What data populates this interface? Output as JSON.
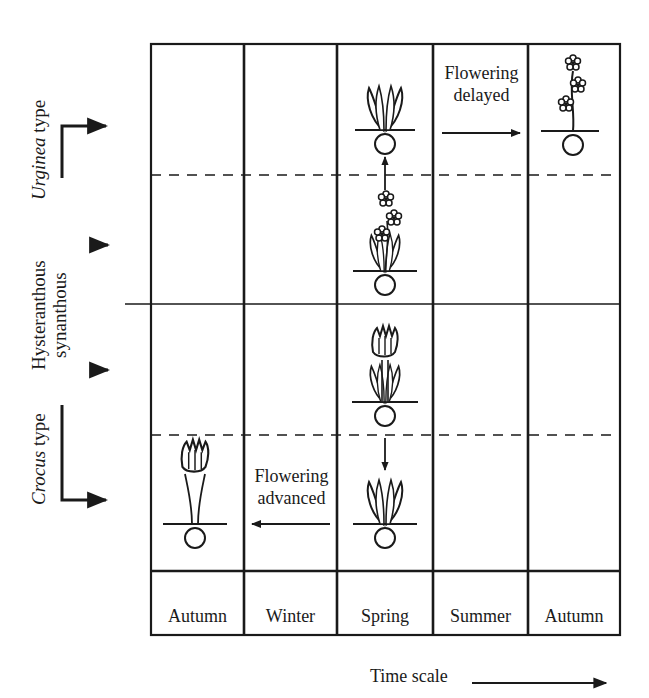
{
  "figure": {
    "row_labels": {
      "urginea": {
        "italic": "Urginea",
        "rest": " type"
      },
      "hysteranthous": "Hysteranthous",
      "synanthous": "synanthous",
      "crocus": {
        "italic": "Crocus",
        "rest": " type"
      }
    },
    "seasons": [
      "Autumn",
      "Winter",
      "Spring",
      "Summer",
      "Autumn"
    ],
    "annotations": {
      "delayed_line1": "Flowering",
      "delayed_line2": "delayed",
      "advanced_line1": "Flowering",
      "advanced_line2": "advanced"
    },
    "time_scale_label": "Time scale",
    "colors": {
      "ink": "#1a1a1a",
      "background": "#ffffff"
    }
  }
}
